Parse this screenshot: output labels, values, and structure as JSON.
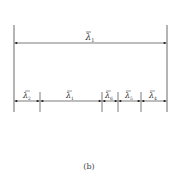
{
  "diagram": {
    "caption": "(b)",
    "colors": {
      "line": "#333333",
      "text": "#333333",
      "background": "#ffffff"
    },
    "overall_dimension": {
      "symbol": "λ",
      "subscript": "1",
      "label": "λ̄1"
    },
    "segments": [
      {
        "symbol": "λ",
        "subscript": "2",
        "label": "λ̄2"
      },
      {
        "symbol": "λ",
        "subscript": "1",
        "label": "λ̄1"
      },
      {
        "symbol": "λ",
        "subscript": "6",
        "label": "λ̄6"
      },
      {
        "symbol": "λ",
        "subscript": "5",
        "label": "λ̄5"
      },
      {
        "symbol": "λ",
        "subscript": "4",
        "label": "λ̄4"
      }
    ]
  }
}
